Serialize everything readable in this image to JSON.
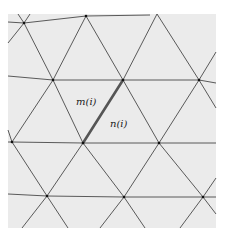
{
  "figure": {
    "background_color": "#ebebeb",
    "line_color": "#333333",
    "highlight_color": "#555555"
  },
  "labels": {
    "left_triangle": "m(i)",
    "right_triangle": "n(i)"
  },
  "nodes": [
    {
      "id": "a",
      "x": 24,
      "y": 23
    },
    {
      "id": "b",
      "x": 86,
      "y": 16
    },
    {
      "id": "c",
      "x": 53,
      "y": 80
    },
    {
      "id": "d",
      "x": 123,
      "y": 80
    },
    {
      "id": "e",
      "x": 199,
      "y": 80
    },
    {
      "id": "f",
      "x": 12,
      "y": 142
    },
    {
      "id": "g",
      "x": 83,
      "y": 143
    },
    {
      "id": "h",
      "x": 159,
      "y": 143
    },
    {
      "id": "i",
      "x": 47,
      "y": 196
    },
    {
      "id": "j",
      "x": 124,
      "y": 197
    },
    {
      "id": "k",
      "x": 203,
      "y": 197
    }
  ],
  "highlighted_edge": {
    "from": "g",
    "to": "d"
  }
}
